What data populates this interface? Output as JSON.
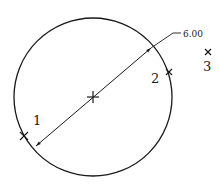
{
  "diagram": {
    "type": "cad-circle-three-point",
    "stroke_color": "#1a1a1a",
    "background": "#ffffff",
    "circle": {
      "cx": 93,
      "cy": 97,
      "r": 79
    },
    "center_mark": {
      "x": 93,
      "y": 97
    },
    "dimension": {
      "kind": "diameter",
      "value": "6.00",
      "from": {
        "x": 36,
        "y": 146
      },
      "to": {
        "x": 151,
        "y": 48
      },
      "leader_elbow": {
        "x": 173,
        "y": 33
      },
      "leader_end": {
        "x": 181,
        "y": 33
      }
    },
    "points": [
      {
        "label": "1",
        "marker": {
          "x": 24,
          "y": 136
        },
        "text": {
          "x": 33,
          "y": 125
        }
      },
      {
        "label": "2",
        "marker": {
          "x": 169,
          "y": 72
        },
        "text": {
          "x": 152,
          "y": 83
        }
      },
      {
        "label": "3",
        "marker": {
          "x": 208,
          "y": 52
        },
        "text": {
          "x": 203,
          "y": 71
        }
      }
    ]
  }
}
